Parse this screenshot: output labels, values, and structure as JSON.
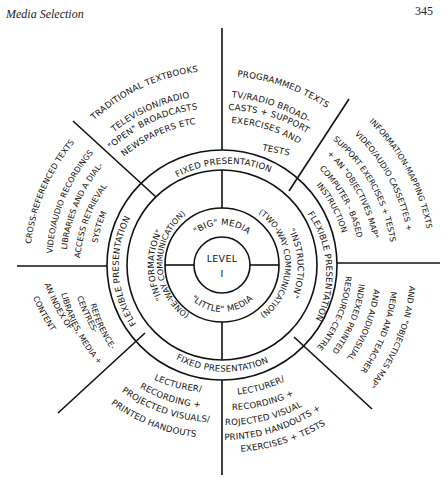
{
  "header": {
    "title": "Media Selection",
    "page_number": "345"
  },
  "diagram": {
    "center": {
      "line1": "LEVEL",
      "line2": "I"
    },
    "media_ring": {
      "top": "\"BIG\" MEDIA",
      "bottom": "\"LITTLE\" MEDIA"
    },
    "communication_ring": {
      "left": "\"INFORMATION\"",
      "left_sub": "(ONE-WAY COMMUNICATION)",
      "right": "\"INSTRUCTION\"",
      "right_sub": "(TWO-WAY COMMUNICATION)"
    },
    "presentation_ring": {
      "top": "FIXED PRESENTATION",
      "bottom": "FIXED PRESENTATION",
      "left": "FLEXIBLE PRESENTATION",
      "right": "FLEXIBLE PRESENTATION"
    },
    "outer_segments": {
      "top_left": {
        "line1": "TRADITIONAL TEXTBOOKS",
        "line2": "TELEVISION/RADIO",
        "line3": "\"OPEN\" BROADCASTS",
        "line4": "NEWSPAPERS ETC"
      },
      "top_right": {
        "line1": "PROGRAMMED TEXTS",
        "line2": "TV/RADIO BROAD-",
        "line3": "CASTS + SUPPORT",
        "line4": "EXERCISES AND",
        "line5": "TESTS"
      },
      "right_upper": {
        "line1": "INFORMATION-MAPPING TEXTS",
        "line2": "VIDEO/AUDIO CASSETTES +",
        "line3": "SUPPORT EXERCISES + TESTS",
        "line4": "+ AN \"OBJECTIVES MAP\"",
        "line5": "COMPUTER - BASED",
        "line6": "INSTRUCTION"
      },
      "right_lower": {
        "line1": "RESOURCE-CENTRE",
        "line2": "INDEXED PRINTED",
        "line3": "AND AUDIOVISUAL",
        "line4": "MEDIA AND TEACHER",
        "line5": "AND AN \"OBJECTIVES MAP\""
      },
      "bottom_right": {
        "line1": "LECTURER/",
        "line2": "RECORDING +",
        "line3": "PROJECTED VISUALS/",
        "line4": "PRINTED HANDOUTS +",
        "line5": "EXERCISES + TESTS"
      },
      "bottom_left": {
        "line1": "LECTURER/",
        "line2": "RECORDING +",
        "line3": "PROJECTED VISUALS/",
        "line4": "PRINTED HANDOUTS"
      },
      "left_lower": {
        "line1": "REFERENCE-",
        "line2": "CENTRES-",
        "line3": "LIBRARIES, MEDIA +",
        "line4": "AN INDEX OF",
        "line5": "CONTENT"
      },
      "left_upper": {
        "line1": "CROSS-REFERENCED TEXTS",
        "line2": "VIDEO/AUDIO RECORDINGS",
        "line3": "LIBRARIES AND A DIAL-",
        "line4": "ACCESS RETRIEVAL",
        "line5": "SYSTEM"
      }
    }
  }
}
